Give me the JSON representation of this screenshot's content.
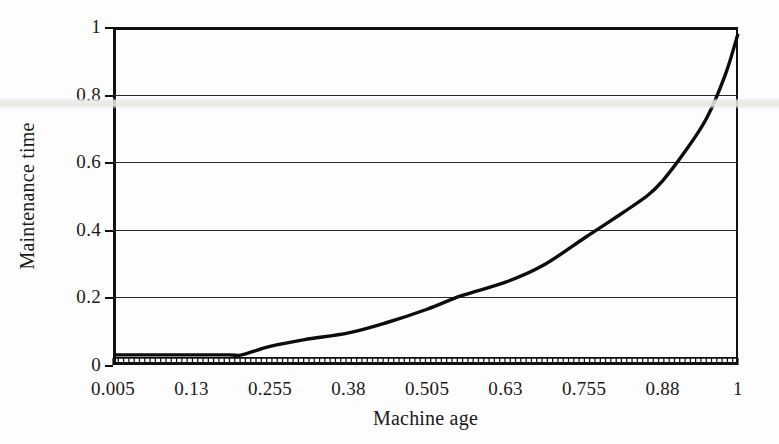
{
  "figure": {
    "kind": "scanned-line-chart",
    "ylabel": "Maintenance time",
    "xlabel": "Machine age",
    "ink_color": "#0d0d0d",
    "grid_color": "#2a2a2a",
    "background_color": "#fdfdfd"
  },
  "chart_data": {
    "type": "line",
    "title": "",
    "subtitle": "",
    "xlabel": "Machine age",
    "ylabel": "Maintenance time",
    "xlim": [
      0.005,
      1
    ],
    "ylim": [
      0,
      1
    ],
    "grid": true,
    "grid_axis": "y",
    "legend": null,
    "legend_position": "none",
    "xtick_labels": [
      "0.005",
      "0.13",
      "0.255",
      "0.38",
      "0.505",
      "0.63",
      "0.755",
      "0.88",
      "1"
    ],
    "xtick_values": [
      0.005,
      0.13,
      0.255,
      0.38,
      0.505,
      0.63,
      0.755,
      0.88,
      1
    ],
    "ytick_labels": [
      "0",
      "0.2",
      "0.4",
      "0.6",
      "0.8",
      "1"
    ],
    "ytick_values": [
      0,
      0.2,
      0.4,
      0.6,
      0.8,
      1
    ],
    "series": [
      {
        "name": "Maintenance time",
        "x": [
          0.005,
          0.06,
          0.13,
          0.19,
          0.21,
          0.255,
          0.31,
          0.38,
          0.44,
          0.505,
          0.56,
          0.63,
          0.69,
          0.755,
          0.8,
          0.855,
          0.88,
          0.915,
          0.95,
          0.98,
          1.0
        ],
        "values": [
          0.03,
          0.03,
          0.03,
          0.03,
          0.03,
          0.055,
          0.075,
          0.095,
          0.125,
          0.165,
          0.205,
          0.245,
          0.295,
          0.375,
          0.43,
          0.5,
          0.545,
          0.63,
          0.73,
          0.86,
          0.98
        ]
      }
    ],
    "annotations": [
      {
        "note": "curve flat near 0.03 until machine age ~0.21, then convex increase"
      },
      {
        "note": "crosses 0.2 at machine age ~0.555"
      },
      {
        "note": "crosses 0.4 at machine age ~0.775"
      },
      {
        "note": "steep rise after 0.88, reaching ~0.98 at machine age 1"
      }
    ],
    "baseline_hatching": {
      "present": true,
      "description": "dense vertical tick hatching along x-axis between 0 and ~0.02",
      "count": 118,
      "top_value": 0.021
    }
  }
}
